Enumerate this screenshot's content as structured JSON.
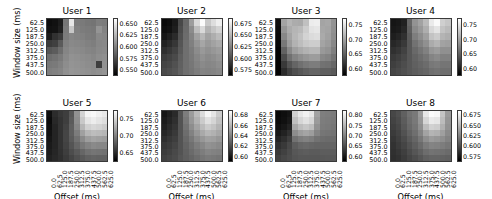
{
  "figure": {
    "type": "heatmap-grid",
    "rows": 2,
    "cols": 4,
    "colormap": "gray",
    "axis_labels": {
      "x": "Offset (ms)",
      "y": "Window size (ms)"
    },
    "xticks": [
      "0.0",
      "62.5",
      "125.0",
      "187.5",
      "250.0",
      "312.5",
      "375.0",
      "437.5",
      "500.0",
      "562.5",
      "625.0"
    ],
    "yticks": [
      "62.5",
      "125.0",
      "187.5",
      "250.0",
      "312.5",
      "375.0",
      "437.5",
      "500.0"
    ]
  },
  "chart_data": {
    "type": "heatmap",
    "title": "",
    "xlabel": "Offset (ms)",
    "ylabel": "Window size (ms)",
    "colormap": "gray",
    "x": [
      0.0,
      62.5,
      125.0,
      187.5,
      250.0,
      312.5,
      375.0,
      437.5,
      500.0,
      562.5,
      625.0
    ],
    "y": [
      62.5,
      125.0,
      187.5,
      250.0,
      312.5,
      375.0,
      437.5,
      500.0
    ],
    "grid": false,
    "legend": "per-panel vertical colorbar, right of each heatmap",
    "panels": [
      {
        "title": "User 1",
        "cbar_ticks": [
          "0.650",
          "0.625",
          "0.600",
          "0.575",
          "0.550"
        ],
        "vmin": 0.543,
        "vmax": 0.662,
        "values": [
          [
            0.549,
            0.551,
            0.556,
            0.598,
            0.651,
            0.601,
            0.6,
            0.598,
            0.597,
            0.602,
            0.601
          ],
          [
            0.551,
            0.552,
            0.558,
            0.6,
            0.636,
            0.603,
            0.601,
            0.6,
            0.599,
            0.612,
            0.604
          ],
          [
            0.556,
            0.566,
            0.571,
            0.601,
            0.606,
            0.604,
            0.603,
            0.601,
            0.6,
            0.607,
            0.606
          ],
          [
            0.57,
            0.573,
            0.585,
            0.603,
            0.607,
            0.606,
            0.605,
            0.603,
            0.602,
            0.606,
            0.607
          ],
          [
            0.583,
            0.586,
            0.594,
            0.605,
            0.609,
            0.608,
            0.607,
            0.605,
            0.604,
            0.607,
            0.608
          ],
          [
            0.594,
            0.596,
            0.6,
            0.607,
            0.611,
            0.61,
            0.609,
            0.608,
            0.606,
            0.609,
            0.61
          ],
          [
            0.599,
            0.6,
            0.603,
            0.609,
            0.612,
            0.611,
            0.61,
            0.609,
            0.608,
            0.572,
            0.611
          ],
          [
            0.602,
            0.603,
            0.605,
            0.61,
            0.613,
            0.612,
            0.611,
            0.61,
            0.609,
            0.61,
            0.612
          ]
        ]
      },
      {
        "title": "User 2",
        "cbar_ticks": [
          "0.675",
          "0.650",
          "0.625",
          "0.600",
          "0.575"
        ],
        "vmin": 0.566,
        "vmax": 0.686,
        "values": [
          [
            0.57,
            0.572,
            0.578,
            0.6,
            0.615,
            0.64,
            0.668,
            0.684,
            0.66,
            0.67,
            0.678
          ],
          [
            0.572,
            0.574,
            0.58,
            0.602,
            0.616,
            0.632,
            0.655,
            0.668,
            0.65,
            0.658,
            0.665
          ],
          [
            0.576,
            0.58,
            0.586,
            0.604,
            0.617,
            0.628,
            0.642,
            0.652,
            0.642,
            0.648,
            0.654
          ],
          [
            0.582,
            0.586,
            0.592,
            0.606,
            0.618,
            0.626,
            0.636,
            0.644,
            0.638,
            0.642,
            0.646
          ],
          [
            0.588,
            0.592,
            0.597,
            0.608,
            0.618,
            0.624,
            0.632,
            0.638,
            0.634,
            0.637,
            0.64
          ],
          [
            0.594,
            0.597,
            0.601,
            0.61,
            0.618,
            0.623,
            0.629,
            0.634,
            0.631,
            0.633,
            0.636
          ],
          [
            0.598,
            0.6,
            0.604,
            0.611,
            0.618,
            0.622,
            0.627,
            0.631,
            0.629,
            0.63,
            0.633
          ],
          [
            0.601,
            0.603,
            0.606,
            0.612,
            0.618,
            0.621,
            0.625,
            0.628,
            0.627,
            0.628,
            0.63
          ]
        ]
      },
      {
        "title": "User 3",
        "cbar_ticks": [
          "0.75",
          "0.70",
          "0.65",
          "0.60"
        ],
        "vmin": 0.581,
        "vmax": 0.766,
        "values": [
          [
            0.592,
            0.7,
            0.712,
            0.706,
            0.704,
            0.72,
            0.752,
            0.754,
            0.7,
            0.702,
            0.688
          ],
          [
            0.59,
            0.69,
            0.706,
            0.712,
            0.716,
            0.73,
            0.746,
            0.748,
            0.702,
            0.7,
            0.686
          ],
          [
            0.588,
            0.68,
            0.7,
            0.714,
            0.722,
            0.734,
            0.74,
            0.742,
            0.704,
            0.698,
            0.684
          ],
          [
            0.586,
            0.668,
            0.694,
            0.71,
            0.718,
            0.726,
            0.73,
            0.73,
            0.7,
            0.694,
            0.68
          ],
          [
            0.584,
            0.652,
            0.68,
            0.696,
            0.704,
            0.71,
            0.714,
            0.714,
            0.692,
            0.688,
            0.674
          ],
          [
            0.584,
            0.636,
            0.662,
            0.676,
            0.684,
            0.69,
            0.694,
            0.694,
            0.68,
            0.676,
            0.666
          ],
          [
            0.584,
            0.622,
            0.642,
            0.654,
            0.662,
            0.668,
            0.672,
            0.672,
            0.664,
            0.662,
            0.656
          ],
          [
            0.584,
            0.612,
            0.628,
            0.638,
            0.644,
            0.65,
            0.654,
            0.654,
            0.65,
            0.65,
            0.646
          ]
        ]
      },
      {
        "title": "User 4",
        "cbar_ticks": [
          "0.75",
          "0.70",
          "0.65",
          "0.60"
        ],
        "vmin": 0.592,
        "vmax": 0.762,
        "values": [
          [
            0.606,
            0.608,
            0.614,
            0.66,
            0.69,
            0.7,
            0.716,
            0.748,
            0.758,
            0.73,
            0.724
          ],
          [
            0.608,
            0.61,
            0.618,
            0.656,
            0.684,
            0.694,
            0.708,
            0.736,
            0.744,
            0.722,
            0.716
          ],
          [
            0.612,
            0.616,
            0.624,
            0.652,
            0.676,
            0.686,
            0.698,
            0.722,
            0.728,
            0.712,
            0.708
          ],
          [
            0.618,
            0.622,
            0.63,
            0.65,
            0.668,
            0.678,
            0.688,
            0.706,
            0.712,
            0.7,
            0.698
          ],
          [
            0.624,
            0.628,
            0.636,
            0.65,
            0.662,
            0.67,
            0.678,
            0.692,
            0.696,
            0.688,
            0.688
          ],
          [
            0.63,
            0.634,
            0.64,
            0.65,
            0.658,
            0.664,
            0.67,
            0.68,
            0.684,
            0.678,
            0.678
          ],
          [
            0.634,
            0.638,
            0.643,
            0.65,
            0.656,
            0.66,
            0.664,
            0.672,
            0.674,
            0.67,
            0.67
          ],
          [
            0.638,
            0.641,
            0.645,
            0.65,
            0.654,
            0.657,
            0.66,
            0.666,
            0.668,
            0.665,
            0.665
          ]
        ]
      },
      {
        "title": "User 5",
        "cbar_ticks": [
          "0.75",
          "0.70",
          "0.65"
        ],
        "vmin": 0.632,
        "vmax": 0.772,
        "values": [
          [
            0.64,
            0.656,
            0.662,
            0.666,
            0.68,
            0.712,
            0.748,
            0.766,
            0.768,
            0.764,
            0.76
          ],
          [
            0.638,
            0.654,
            0.66,
            0.666,
            0.682,
            0.71,
            0.742,
            0.758,
            0.762,
            0.758,
            0.754
          ],
          [
            0.64,
            0.652,
            0.66,
            0.668,
            0.684,
            0.706,
            0.732,
            0.746,
            0.75,
            0.748,
            0.744
          ],
          [
            0.642,
            0.652,
            0.66,
            0.67,
            0.684,
            0.7,
            0.72,
            0.732,
            0.736,
            0.734,
            0.732
          ],
          [
            0.644,
            0.652,
            0.66,
            0.67,
            0.682,
            0.694,
            0.708,
            0.718,
            0.722,
            0.72,
            0.718
          ],
          [
            0.646,
            0.652,
            0.66,
            0.668,
            0.678,
            0.688,
            0.698,
            0.704,
            0.708,
            0.706,
            0.706
          ],
          [
            0.648,
            0.653,
            0.659,
            0.666,
            0.674,
            0.681,
            0.688,
            0.694,
            0.696,
            0.695,
            0.694
          ],
          [
            0.65,
            0.654,
            0.658,
            0.664,
            0.67,
            0.676,
            0.681,
            0.685,
            0.687,
            0.686,
            0.686
          ]
        ]
      },
      {
        "title": "User 6",
        "cbar_ticks": [
          "0.68",
          "0.66",
          "0.64",
          "0.62",
          "0.60"
        ],
        "vmin": 0.592,
        "vmax": 0.69,
        "values": [
          [
            0.6,
            0.604,
            0.608,
            0.624,
            0.64,
            0.652,
            0.664,
            0.676,
            0.686,
            0.68,
            0.67
          ],
          [
            0.602,
            0.606,
            0.61,
            0.624,
            0.638,
            0.65,
            0.66,
            0.67,
            0.678,
            0.674,
            0.666
          ],
          [
            0.604,
            0.608,
            0.612,
            0.624,
            0.636,
            0.646,
            0.655,
            0.664,
            0.67,
            0.667,
            0.661
          ],
          [
            0.607,
            0.61,
            0.614,
            0.624,
            0.634,
            0.642,
            0.65,
            0.657,
            0.662,
            0.66,
            0.656
          ],
          [
            0.61,
            0.613,
            0.616,
            0.624,
            0.632,
            0.638,
            0.645,
            0.65,
            0.654,
            0.653,
            0.65
          ],
          [
            0.613,
            0.615,
            0.618,
            0.624,
            0.63,
            0.635,
            0.64,
            0.644,
            0.648,
            0.647,
            0.645
          ],
          [
            0.615,
            0.617,
            0.62,
            0.624,
            0.629,
            0.633,
            0.637,
            0.64,
            0.643,
            0.642,
            0.641
          ],
          [
            0.617,
            0.619,
            0.621,
            0.625,
            0.628,
            0.631,
            0.634,
            0.637,
            0.639,
            0.638,
            0.637
          ]
        ]
      },
      {
        "title": "User 7",
        "cbar_ticks": [
          "0.80",
          "0.75",
          "0.70",
          "0.65",
          "0.60"
        ],
        "vmin": 0.588,
        "vmax": 0.812,
        "values": [
          [
            0.596,
            0.6,
            0.606,
            0.77,
            0.79,
            0.8,
            0.79,
            0.73,
            0.7,
            0.698,
            0.696
          ],
          [
            0.598,
            0.602,
            0.61,
            0.756,
            0.776,
            0.786,
            0.776,
            0.724,
            0.698,
            0.696,
            0.694
          ],
          [
            0.602,
            0.608,
            0.618,
            0.736,
            0.754,
            0.762,
            0.754,
            0.716,
            0.696,
            0.694,
            0.692
          ],
          [
            0.61,
            0.618,
            0.63,
            0.712,
            0.726,
            0.732,
            0.726,
            0.704,
            0.692,
            0.69,
            0.688
          ],
          [
            0.62,
            0.628,
            0.642,
            0.688,
            0.698,
            0.702,
            0.698,
            0.688,
            0.684,
            0.682,
            0.682
          ],
          [
            0.63,
            0.638,
            0.65,
            0.67,
            0.678,
            0.68,
            0.678,
            0.676,
            0.676,
            0.676,
            0.676
          ],
          [
            0.638,
            0.645,
            0.654,
            0.664,
            0.668,
            0.67,
            0.668,
            0.668,
            0.67,
            0.67,
            0.67
          ],
          [
            0.644,
            0.65,
            0.656,
            0.662,
            0.664,
            0.664,
            0.664,
            0.664,
            0.665,
            0.666,
            0.666
          ]
        ]
      },
      {
        "title": "User 8",
        "cbar_ticks": [
          "0.675",
          "0.650",
          "0.625",
          "0.600",
          "0.575"
        ],
        "vmin": 0.566,
        "vmax": 0.688,
        "values": [
          [
            0.6,
            0.604,
            0.612,
            0.62,
            0.624,
            0.64,
            0.676,
            0.686,
            0.684,
            0.66,
            0.64
          ],
          [
            0.598,
            0.602,
            0.61,
            0.618,
            0.624,
            0.638,
            0.668,
            0.678,
            0.676,
            0.656,
            0.638
          ],
          [
            0.596,
            0.6,
            0.608,
            0.616,
            0.622,
            0.634,
            0.656,
            0.666,
            0.664,
            0.65,
            0.636
          ],
          [
            0.594,
            0.598,
            0.605,
            0.613,
            0.619,
            0.629,
            0.644,
            0.652,
            0.65,
            0.642,
            0.632
          ],
          [
            0.592,
            0.596,
            0.602,
            0.609,
            0.615,
            0.623,
            0.634,
            0.64,
            0.638,
            0.634,
            0.628
          ],
          [
            0.59,
            0.594,
            0.599,
            0.605,
            0.611,
            0.617,
            0.625,
            0.629,
            0.628,
            0.626,
            0.623
          ],
          [
            0.589,
            0.592,
            0.596,
            0.602,
            0.607,
            0.612,
            0.618,
            0.621,
            0.62,
            0.619,
            0.617
          ],
          [
            0.588,
            0.59,
            0.594,
            0.599,
            0.603,
            0.607,
            0.612,
            0.614,
            0.614,
            0.613,
            0.612
          ]
        ]
      }
    ]
  }
}
